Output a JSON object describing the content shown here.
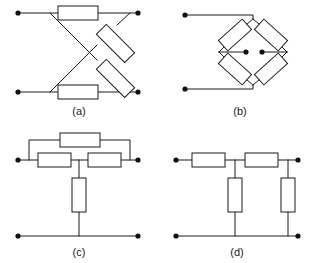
{
  "figure": {
    "kind": "circuit-diagram-sheet",
    "panel_count": 4,
    "background_color": "#ffffff",
    "line_color": "#1a1a1a",
    "dot_color": "#111111",
    "labels": {
      "a": "(a)",
      "b": "(b)",
      "c": "(c)",
      "d": "(d)"
    },
    "panels": [
      {
        "id": "a",
        "label": "(a)",
        "topology": "lattice-bridge",
        "description": "Two horizontal resistors on the top and bottom rails with two diagonal resistors crossing in an X between the rails",
        "resistor_count": 4,
        "terminal_count": 4,
        "resistors": [
          {
            "name": "top-series-resistor",
            "orientation": "horizontal"
          },
          {
            "name": "bottom-series-resistor",
            "orientation": "horizontal"
          },
          {
            "name": "diagonal-resistor-upper-right",
            "orientation": "diagonal"
          },
          {
            "name": "diagonal-resistor-lower-right",
            "orientation": "diagonal"
          }
        ],
        "terminals": [
          {
            "name": "terminal-top-left"
          },
          {
            "name": "terminal-top-right"
          },
          {
            "name": "terminal-bottom-left"
          },
          {
            "name": "terminal-bottom-right"
          }
        ]
      },
      {
        "id": "b",
        "label": "(b)",
        "topology": "diamond-bridge",
        "description": "Four resistors arranged as the sides of a diamond, with two center nodes tied by short leads to the left and right diamond vertices",
        "resistor_count": 4,
        "terminal_count": 4,
        "resistors": [
          {
            "name": "diamond-resistor-top-left",
            "orientation": "diagonal"
          },
          {
            "name": "diamond-resistor-top-right",
            "orientation": "diagonal"
          },
          {
            "name": "diamond-resistor-bottom-left",
            "orientation": "diagonal"
          },
          {
            "name": "diamond-resistor-bottom-right",
            "orientation": "diagonal"
          }
        ],
        "terminals": [
          {
            "name": "terminal-left"
          },
          {
            "name": "terminal-bottom-left"
          },
          {
            "name": "node-center-left"
          },
          {
            "name": "node-center-right"
          }
        ]
      },
      {
        "id": "c",
        "label": "(c)",
        "topology": "bridged-T-network",
        "description": "Two series resistors with a shunt resistor at the midpoint to the bottom rail, plus one bridging resistor routed over the top",
        "resistor_count": 4,
        "terminal_count": 4,
        "resistors": [
          {
            "name": "bridge-resistor-top",
            "orientation": "horizontal"
          },
          {
            "name": "series-resistor-left",
            "orientation": "horizontal"
          },
          {
            "name": "series-resistor-right",
            "orientation": "horizontal"
          },
          {
            "name": "shunt-resistor-center",
            "orientation": "vertical"
          }
        ],
        "terminals": [
          {
            "name": "terminal-top-left"
          },
          {
            "name": "terminal-top-right"
          },
          {
            "name": "terminal-bottom-left"
          },
          {
            "name": "terminal-bottom-right"
          }
        ]
      },
      {
        "id": "d",
        "label": "(d)",
        "topology": "ladder-network",
        "description": "Two series resistors along the top rail with two shunt resistors dropping to the bottom rail",
        "resistor_count": 4,
        "terminal_count": 4,
        "resistors": [
          {
            "name": "series-resistor-left",
            "orientation": "horizontal"
          },
          {
            "name": "series-resistor-right",
            "orientation": "horizontal"
          },
          {
            "name": "shunt-resistor-left",
            "orientation": "vertical"
          },
          {
            "name": "shunt-resistor-right",
            "orientation": "vertical"
          }
        ],
        "terminals": [
          {
            "name": "terminal-top-left"
          },
          {
            "name": "terminal-top-right"
          },
          {
            "name": "terminal-bottom-left"
          },
          {
            "name": "terminal-bottom-right"
          }
        ]
      }
    ]
  }
}
